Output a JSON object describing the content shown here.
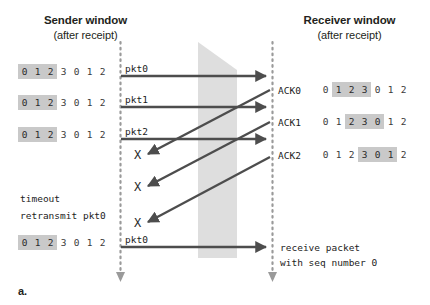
{
  "figure": {
    "panel_label": "a.",
    "background_color": "#ffffff",
    "arrow_color": "#4d4d4d",
    "timeline_color": "#9a9a9a",
    "highlight_color": "#c9c9c9",
    "medium_fill_color": "#d8d8d8"
  },
  "headers": {
    "sender": {
      "title": "Sender window",
      "subtitle": "(after receipt)"
    },
    "receiver": {
      "title": "Receiver window",
      "subtitle": "(after receipt)"
    }
  },
  "sender_windows": [
    {
      "cells": [
        "0",
        "1",
        "2",
        "3",
        "0",
        "1",
        "2"
      ],
      "highlight": [
        0,
        1,
        2
      ]
    },
    {
      "cells": [
        "0",
        "1",
        "2",
        "3",
        "0",
        "1",
        "2"
      ],
      "highlight": [
        0,
        1,
        2
      ]
    },
    {
      "cells": [
        "0",
        "1",
        "2",
        "3",
        "0",
        "1",
        "2"
      ],
      "highlight": [
        0,
        1,
        2
      ]
    },
    {
      "cells": [
        "0",
        "1",
        "2",
        "3",
        "0",
        "1",
        "2"
      ],
      "highlight": [
        0,
        1,
        2
      ]
    }
  ],
  "receiver_windows": [
    {
      "label": "ACK0",
      "cells": [
        "0",
        "1",
        "2",
        "3",
        "0",
        "1",
        "2"
      ],
      "highlight": [
        1,
        2,
        3
      ]
    },
    {
      "label": "ACK1",
      "cells": [
        "0",
        "1",
        "2",
        "3",
        "0",
        "1",
        "2"
      ],
      "highlight": [
        2,
        3,
        4
      ]
    },
    {
      "label": "ACK2",
      "cells": [
        "0",
        "1",
        "2",
        "3",
        "0",
        "1",
        "2"
      ],
      "highlight": [
        3,
        4,
        5
      ]
    }
  ],
  "packet_labels": [
    "pkt0",
    "pkt1",
    "pkt2"
  ],
  "retransmit_label": "pkt0",
  "timeout_text": {
    "line1": "timeout",
    "line2": "retransmit pkt0"
  },
  "receive_text": {
    "line1": "receive packet",
    "line2": "with seq number 0"
  },
  "loss_marks": [
    "X",
    "X",
    "X"
  ]
}
